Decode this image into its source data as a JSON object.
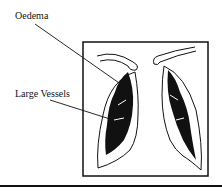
{
  "figure": {
    "labels": {
      "oedema": "Oedema",
      "large_vessels": "Large Vessels"
    }
  }
}
